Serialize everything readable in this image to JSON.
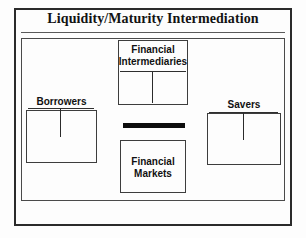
{
  "figure": {
    "title": "Liquidity/Maturity Intermediation",
    "type": "diagram",
    "colors": {
      "frame": "#2b2b2b",
      "box_border": "#3d3d3d",
      "text": "#111111",
      "connector_bar": "#0d0d0d",
      "background": "#fdfdfd"
    }
  },
  "nodes": {
    "financial_intermediaries": {
      "label_line_1": "Financial",
      "label_line_2": "Intermediaries",
      "position": "top-center"
    },
    "borrowers": {
      "label": "Borrowers",
      "position": "left"
    },
    "savers": {
      "label": "Savers",
      "position": "right"
    },
    "financial_markets": {
      "label_line_1": "Financial",
      "label_line_2": "Markets",
      "position": "bottom-center"
    }
  },
  "connectors": {
    "bar_above_financial_markets": "solid-black-bar",
    "tee_financial_intermediaries": "vertical-line",
    "tee_borrowers": "vertical-line",
    "tee_savers": "vertical-line"
  }
}
